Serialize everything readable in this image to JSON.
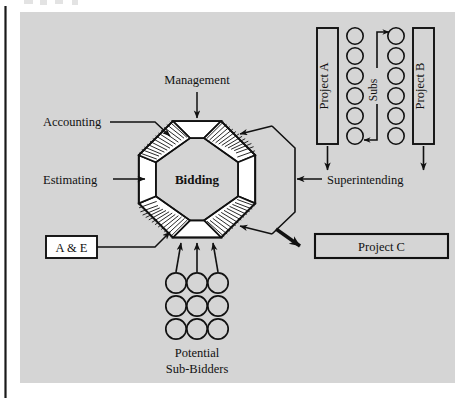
{
  "figure": {
    "kind": "organization-flow-diagram",
    "background_color": "#d5d5d5",
    "page_color": "#ffffff",
    "ink_color": "#111111",
    "segment_fill": "#ffffff"
  },
  "center": {
    "label": "Bidding"
  },
  "inputs": {
    "management": "Management",
    "accounting": "Accounting",
    "estimating": "Estimating",
    "ae": "A & E",
    "superintending": "Superintending"
  },
  "projects": {
    "a": "Project A",
    "b": "Project B",
    "c": "Project C"
  },
  "subs": {
    "label": "Subs",
    "column_count": 2,
    "per_column": 6
  },
  "sub_bidders": {
    "line1": "Potential",
    "line2": "Sub-Bidders",
    "rows": 3,
    "columns": 3,
    "arrow_count": 3
  },
  "octagon": {
    "segments": [
      {
        "position": "north",
        "style": "plain"
      },
      {
        "position": "northeast",
        "style": "hatched"
      },
      {
        "position": "east",
        "style": "plain"
      },
      {
        "position": "southeast",
        "style": "hatched"
      },
      {
        "position": "south",
        "style": "plain"
      },
      {
        "position": "southwest",
        "style": "hatched"
      },
      {
        "position": "west",
        "style": "plain"
      },
      {
        "position": "northwest",
        "style": "hatched"
      }
    ]
  }
}
